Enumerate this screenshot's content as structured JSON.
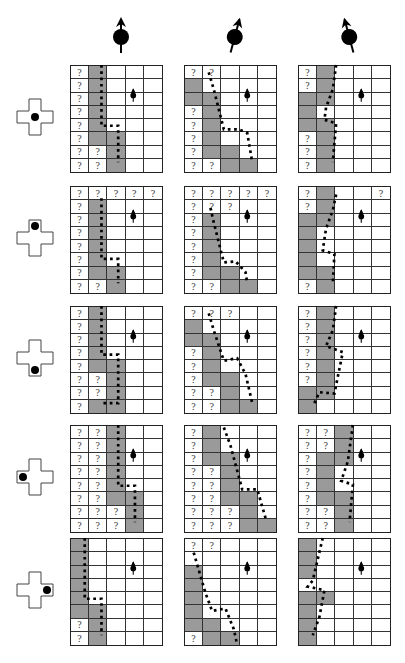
{
  "figure": {
    "rows": 5,
    "cols": 3,
    "grid_size": {
      "cols": 5,
      "rows": 8
    },
    "legend": {
      "unknown_symbol": "?",
      "occupied_color": "#9a9a9a",
      "free_color": "#ffffff",
      "path_style": "dashed-black"
    },
    "robot_cell": {
      "row": 2,
      "col": 3
    },
    "column_headers": [
      {
        "icon": "robot-heading-up-icon",
        "heading_deg": 0
      },
      {
        "icon": "robot-heading-slight-right-icon",
        "heading_deg": 15
      },
      {
        "icon": "robot-heading-slight-left-icon",
        "heading_deg": -15
      }
    ],
    "row_sensors": [
      {
        "icon": "sensor-cross-center-icon",
        "dot": "center"
      },
      {
        "icon": "sensor-cross-top-icon",
        "dot": "top"
      },
      {
        "icon": "sensor-cross-bottom-icon",
        "dot": "bottom"
      },
      {
        "icon": "sensor-cross-left-icon",
        "dot": "left"
      },
      {
        "icon": "sensor-cross-right-icon",
        "dot": "right"
      }
    ],
    "panels": [
      [
        {
          "cells": [
            "?g...",
            "?g...",
            "?g...",
            "?g...",
            "?g...",
            "?gg..",
            "??g..",
            "??g.."
          ],
          "path": [
            [
              1.6,
              0
            ],
            [
              1.6,
              5
            ],
            [
              2.6,
              5
            ],
            [
              2.6,
              8
            ]
          ]
        },
        {
          "cells": [
            "??...",
            "g....",
            "gg...",
            "?g...",
            "?g...",
            "?g...",
            "?gg..",
            "??gg."
          ],
          "path": [
            [
              1.2,
              0.6
            ],
            [
              1.5,
              2
            ],
            [
              2.1,
              5.3
            ],
            [
              3.0,
              5.3
            ],
            [
              3.5,
              5.6
            ],
            [
              3.8,
              8
            ]
          ]
        },
        {
          "cells": [
            "?g...",
            "?g...",
            "gg...",
            "gw...",
            "gg...",
            "?g...",
            "?g...",
            "?g..."
          ],
          "path": [
            [
              2.0,
              0
            ],
            [
              1.8,
              2
            ],
            [
              1.4,
              3.5
            ],
            [
              1.3,
              4.5
            ],
            [
              2.0,
              4.8
            ],
            [
              1.8,
              8
            ]
          ]
        }
      ],
      [
        {
          "cells": [
            "?????",
            "?g...",
            "?g...",
            "?g...",
            "?g...",
            "?g...",
            "?gg..",
            "??g.."
          ],
          "path": [
            [
              1.6,
              1
            ],
            [
              1.6,
              6
            ],
            [
              2.6,
              6
            ],
            [
              2.6,
              8
            ]
          ]
        },
        {
          "cells": [
            "?????",
            "???..",
            "?g...",
            "?g...",
            "?g...",
            "?g...",
            "?gg..",
            "??gg."
          ],
          "path": [
            [
              1.3,
              1.8
            ],
            [
              1.5,
              3
            ],
            [
              2.1,
              6.3
            ],
            [
              2.8,
              6.2
            ],
            [
              3.4,
              7.1
            ],
            [
              3.5,
              8
            ]
          ]
        },
        {
          "cells": [
            "?g..?",
            "?g...",
            "gg...",
            "gw...",
            "gw...",
            "gw...",
            "gg...",
            "?g..."
          ],
          "path": [
            [
              2.0,
              0.7
            ],
            [
              1.8,
              2
            ],
            [
              1.4,
              3.5
            ],
            [
              1.2,
              5.3
            ],
            [
              1.9,
              5.6
            ],
            [
              1.8,
              8
            ]
          ]
        }
      ],
      [
        {
          "cells": [
            "?g...",
            "?g...",
            "?g...",
            "?g...",
            "?gg..",
            "??g..",
            "??g..",
            "?gg.."
          ],
          "path": [
            [
              1.6,
              0
            ],
            [
              1.6,
              4
            ],
            [
              2.6,
              4
            ],
            [
              2.6,
              8
            ],
            [
              1.6,
              8
            ]
          ]
        },
        {
          "cells": [
            "???..",
            "g....",
            "gg...",
            "?g...",
            "?g...",
            "?gg..",
            "??g..",
            "??gg."
          ],
          "path": [
            [
              1.2,
              0.6
            ],
            [
              1.5,
              2
            ],
            [
              2.1,
              4.5
            ],
            [
              2.9,
              4.3
            ],
            [
              3.4,
              5.6
            ],
            [
              3.8,
              8
            ]
          ]
        },
        {
          "cells": [
            "?g...",
            "?g...",
            "?g...",
            "?g...",
            "?g...",
            "?g...",
            "gg...",
            "gw..."
          ],
          "path": [
            [
              2.0,
              0
            ],
            [
              1.8,
              2
            ],
            [
              1.4,
              3.3
            ],
            [
              2.4,
              3.8
            ],
            [
              2.0,
              6.5
            ],
            [
              1.9,
              7.2
            ],
            [
              1.0,
              7.1
            ],
            [
              0.7,
              8
            ]
          ]
        }
      ],
      [
        {
          "cells": [
            "??g..",
            "??g..",
            "??g..",
            "??g..",
            "??g..",
            "??gg.",
            "???g.",
            "???g."
          ],
          "path": [
            [
              2.6,
              0
            ],
            [
              2.6,
              5
            ],
            [
              3.6,
              5
            ],
            [
              3.6,
              8
            ]
          ]
        },
        {
          "cells": [
            "?g...",
            "?g...",
            "?gg..",
            "??g..",
            "??g..",
            "??gg.",
            "???g.",
            "???gg"
          ],
          "path": [
            [
              2.1,
              0.2
            ],
            [
              2.5,
              1.7
            ],
            [
              3.2,
              5.3
            ],
            [
              4.1,
              5.3
            ],
            [
              4.6,
              7.7
            ]
          ]
        },
        {
          "cells": [
            "??g..",
            "??g..",
            "?gg..",
            "?gw..",
            "?gw..",
            "?gg..",
            "??g..",
            "??g.."
          ],
          "path": [
            [
              3.0,
              0
            ],
            [
              2.7,
              3
            ],
            [
              2.3,
              4.6
            ],
            [
              3.0,
              4.9
            ],
            [
              2.8,
              8
            ]
          ]
        }
      ],
      [
        {
          "cells": [
            "g....",
            "g....",
            "g....",
            "g....",
            "g....",
            "gg...",
            "?g...",
            "?g..."
          ],
          "path": [
            [
              0.6,
              0
            ],
            [
              0.6,
              5
            ],
            [
              1.6,
              5
            ],
            [
              1.6,
              8
            ]
          ]
        },
        {
          "cells": [
            "??...",
            "w....",
            "g....",
            "g....",
            "g....",
            "g....",
            "gg...",
            "?gg.."
          ],
          "path": [
            [
              0.3,
              1.2
            ],
            [
              1.0,
              4.5
            ],
            [
              1.4,
              6
            ],
            [
              2.2,
              5.8
            ],
            [
              2.7,
              7.5
            ],
            [
              2.9,
              8.8
            ]
          ]
        },
        {
          "cells": [
            "g....",
            "g....",
            "g....",
            "w....",
            "gg...",
            "g....",
            "g....",
            "g...."
          ],
          "path": [
            [
              1.2,
              0
            ],
            [
              0.6,
              3.5
            ],
            [
              0.3,
              4.0
            ],
            [
              1.3,
              4.3
            ],
            [
              1.0,
              6.5
            ],
            [
              0.6,
              8
            ]
          ]
        }
      ]
    ]
  }
}
